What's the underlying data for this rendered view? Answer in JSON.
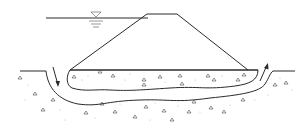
{
  "diagram": {
    "type": "dam-cross-section-seepage",
    "elements": {
      "water_level_symbol": "inverted-triangle-water-level",
      "embankment": "trapezoidal-dam-body",
      "ground_surface": "horizontal-ground-line",
      "foundation_trench": "excavated-trench-with-backfill",
      "seepage_path": "u-shaped-flow-band",
      "inflow_arrow": "downward-arrow-upstream",
      "outflow_arrow": "upward-arrow-downstream",
      "soil_hatch": "triangle-and-dot-gravel-pattern"
    },
    "colors": {
      "line": "#2a2a2a",
      "background": "#ffffff",
      "hatch": "#444444"
    }
  }
}
